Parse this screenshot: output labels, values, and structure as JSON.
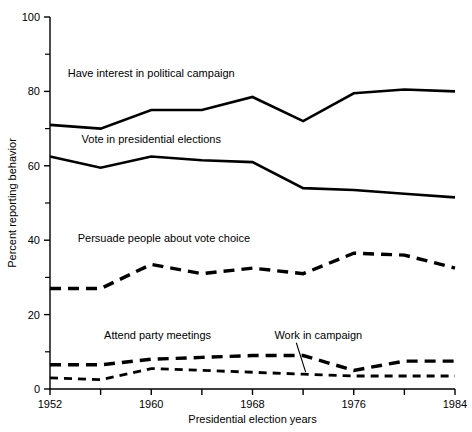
{
  "chart_data": {
    "type": "line",
    "title": "",
    "xlabel": "Presidential election years",
    "ylabel": "Percent reporting behavior",
    "x": [
      1952,
      1956,
      1960,
      1964,
      1968,
      1972,
      1976,
      1980,
      1984
    ],
    "xtick_labels": [
      "1952",
      "",
      "1960",
      "",
      "1968",
      "",
      "1976",
      "",
      "1984"
    ],
    "xlim": [
      1952,
      1984
    ],
    "ylim": [
      0,
      100
    ],
    "ytick_labels": [
      "0",
      "20",
      "40",
      "60",
      "80",
      "100"
    ],
    "ytick_values": [
      0,
      20,
      40,
      60,
      80,
      100
    ],
    "yminor_values": [
      10,
      30,
      50,
      70,
      90
    ],
    "grid": false,
    "legend_position": "inline-annotations",
    "series": [
      {
        "name": "Have interest in political campaign",
        "style": "solid",
        "label_x": 1960,
        "label_y": 84,
        "values": [
          71,
          70,
          75,
          75,
          78.5,
          72,
          79.5,
          80.5,
          80
        ]
      },
      {
        "name": "Vote in presidential elections",
        "style": "solid",
        "label_x": 1960,
        "label_y": 66,
        "values": [
          62.5,
          59.5,
          62.5,
          61.5,
          61,
          54,
          53.5,
          52.5,
          51.5
        ]
      },
      {
        "name": "Persuade people about vote choice",
        "style": "dashed",
        "label_x": 1961,
        "label_y": 39.5,
        "values": [
          27,
          27,
          33.5,
          31,
          32.5,
          31,
          36.5,
          36,
          32.5
        ]
      },
      {
        "name": "Attend party meetings",
        "style": "dashed",
        "label_x": 1960.5,
        "label_y": 13.5,
        "values": [
          6.5,
          6.5,
          8,
          8.5,
          9,
          9,
          5,
          7.5,
          7.5
        ]
      },
      {
        "name": "Work in campaign",
        "style": "dashed-thin",
        "label_x": 1973.2,
        "label_y": 13.5,
        "leader": true,
        "values": [
          3,
          2.5,
          5.5,
          5,
          4.5,
          4,
          3.5,
          3.5,
          3.5
        ]
      }
    ]
  }
}
